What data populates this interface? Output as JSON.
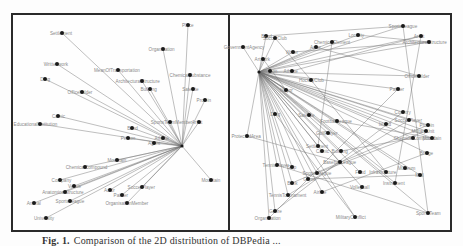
{
  "caption": {
    "label": "Fig. 1.",
    "text": "Comparison of the 2D distribution of DBPedia ..."
  },
  "panels": [
    {
      "id": "left",
      "hub": {
        "x": 182,
        "y": 146
      },
      "nodes": [
        {
          "label": "Place",
          "x": 188,
          "y": 25
        },
        {
          "label": "Settlement",
          "x": 62,
          "y": 33
        },
        {
          "label": "Organisation",
          "x": 163,
          "y": 49
        },
        {
          "label": "Writtenwork",
          "x": 57,
          "y": 64
        },
        {
          "label": "MeanOfTransportation",
          "x": 118,
          "y": 70
        },
        {
          "label": "ChemicalSubstance",
          "x": 190,
          "y": 75
        },
        {
          "label": "Drug",
          "x": 45,
          "y": 79
        },
        {
          "label": "ArchitecturalStructure",
          "x": 142,
          "y": 81
        },
        {
          "label": "Building",
          "x": 150,
          "y": 89
        },
        {
          "label": "Satellite",
          "x": 193,
          "y": 89
        },
        {
          "label": "Officeholder",
          "x": 82,
          "y": 92
        },
        {
          "label": "Protein",
          "x": 205,
          "y": 100
        },
        {
          "label": "Comic",
          "x": 58,
          "y": 116
        },
        {
          "label": "EducationalInstitution",
          "x": 40,
          "y": 124
        },
        {
          "label": "Band",
          "x": 132,
          "y": 128
        },
        {
          "label": "SportsTeamMember",
          "x": 170,
          "y": 122
        },
        {
          "label": "Artist",
          "x": 199,
          "y": 122
        },
        {
          "label": "Person",
          "x": 128,
          "y": 138
        },
        {
          "label": "Athlete",
          "x": 163,
          "y": 138
        },
        {
          "label": "Agent",
          "x": 154,
          "y": 143
        },
        {
          "label": "Mountain",
          "x": 117,
          "y": 160
        },
        {
          "label": "ChemicalCompound",
          "x": 85,
          "y": 167
        },
        {
          "label": "Company",
          "x": 60,
          "y": 180
        },
        {
          "label": "Venue",
          "x": 74,
          "y": 186
        },
        {
          "label": "AnatomicalStructure",
          "x": 65,
          "y": 192
        },
        {
          "label": "Animal",
          "x": 34,
          "y": 203
        },
        {
          "label": "SportsLeague",
          "x": 70,
          "y": 201
        },
        {
          "label": "Actor",
          "x": 110,
          "y": 190
        },
        {
          "label": "Painter",
          "x": 122,
          "y": 195
        },
        {
          "label": "SoccerPlayer",
          "x": 142,
          "y": 187
        },
        {
          "label": "OrganisationMember",
          "x": 127,
          "y": 203
        },
        {
          "label": "Mountain",
          "x": 211,
          "y": 180
        },
        {
          "label": "University",
          "x": 46,
          "y": 218
        }
      ]
    },
    {
      "id": "right",
      "hub": {
        "x": 259,
        "y": 72
      },
      "nodes": [
        {
          "label": "SportsLeague",
          "x": 403,
          "y": 26
        },
        {
          "label": "Band",
          "x": 266,
          "y": 36
        },
        {
          "label": "SoccerClub",
          "x": 275,
          "y": 38
        },
        {
          "label": "Locality",
          "x": 358,
          "y": 35
        },
        {
          "label": "Artist",
          "x": 421,
          "y": 36
        },
        {
          "label": "ChemicalElement",
          "x": 332,
          "y": 42
        },
        {
          "label": "ArchitecturalStructure",
          "x": 429,
          "y": 42
        },
        {
          "label": "GovernmentAgency",
          "x": 243,
          "y": 47
        },
        {
          "label": "Writer",
          "x": 293,
          "y": 52
        },
        {
          "label": "Actor",
          "x": 316,
          "y": 47
        },
        {
          "label": "Artwork",
          "x": 263,
          "y": 59
        },
        {
          "label": "Person",
          "x": 270,
          "y": 71
        },
        {
          "label": "Athlete",
          "x": 292,
          "y": 71
        },
        {
          "label": "HockeyClub",
          "x": 311,
          "y": 80
        },
        {
          "label": "Officeholder",
          "x": 419,
          "y": 76
        },
        {
          "label": "Painter",
          "x": 398,
          "y": 89
        },
        {
          "label": "Mayor",
          "x": 286,
          "y": 90
        },
        {
          "label": "Country",
          "x": 403,
          "y": 112
        },
        {
          "label": "Drug",
          "x": 275,
          "y": 114
        },
        {
          "label": "ProtectedArea",
          "x": 247,
          "y": 136
        },
        {
          "label": "Satellite",
          "x": 309,
          "y": 115
        },
        {
          "label": "FootballLeague",
          "x": 337,
          "y": 121
        },
        {
          "label": "Island",
          "x": 386,
          "y": 124
        },
        {
          "label": "SoccerPlayer",
          "x": 409,
          "y": 120
        },
        {
          "label": "Protein",
          "x": 428,
          "y": 125
        },
        {
          "label": "GolfPlayer",
          "x": 328,
          "y": 133
        },
        {
          "label": "MilitaryUnit",
          "x": 426,
          "y": 131
        },
        {
          "label": "ChemicalCompound",
          "x": 413,
          "y": 138
        },
        {
          "label": "Mountain",
          "x": 432,
          "y": 138
        },
        {
          "label": "Settlement",
          "x": 318,
          "y": 146
        },
        {
          "label": "Comic",
          "x": 322,
          "y": 151
        },
        {
          "label": "Building",
          "x": 341,
          "y": 151
        },
        {
          "label": "BaseballLeague",
          "x": 340,
          "y": 162
        },
        {
          "label": "Bridge",
          "x": 427,
          "y": 153
        },
        {
          "label": "TennisPlayer",
          "x": 277,
          "y": 165
        },
        {
          "label": "Ship",
          "x": 292,
          "y": 167
        },
        {
          "label": "SportsLeague",
          "x": 317,
          "y": 173
        },
        {
          "label": "Food",
          "x": 360,
          "y": 172
        },
        {
          "label": "Infrastructure",
          "x": 386,
          "y": 172
        },
        {
          "label": "Museum",
          "x": 405,
          "y": 168
        },
        {
          "label": "Mall",
          "x": 420,
          "y": 175
        },
        {
          "label": "Game",
          "x": 308,
          "y": 179
        },
        {
          "label": "Bank",
          "x": 292,
          "y": 183
        },
        {
          "label": "Instrument",
          "x": 395,
          "y": 183
        },
        {
          "label": "TennisTournament",
          "x": 288,
          "y": 195
        },
        {
          "label": "Volleyball",
          "x": 362,
          "y": 187
        },
        {
          "label": "Airline",
          "x": 322,
          "y": 192
        },
        {
          "label": "Genre",
          "x": 275,
          "y": 211
        },
        {
          "label": "Organisation",
          "x": 269,
          "y": 218
        },
        {
          "label": "MilitaryConflict",
          "x": 355,
          "y": 217
        },
        {
          "label": "SportsTeam",
          "x": 428,
          "y": 213
        }
      ],
      "extra_edges": [
        [
          [
            266,
            36
          ],
          [
            403,
            26
          ]
        ],
        [
          [
            292,
            71
          ],
          [
            421,
            36
          ]
        ],
        [
          [
            293,
            52
          ],
          [
            429,
            42
          ]
        ],
        [
          [
            316,
            47
          ],
          [
            419,
            76
          ]
        ],
        [
          [
            332,
            42
          ],
          [
            318,
            146
          ]
        ],
        [
          [
            358,
            35
          ],
          [
            429,
            42
          ]
        ],
        [
          [
            403,
            26
          ],
          [
            428,
            213
          ]
        ],
        [
          [
            421,
            36
          ],
          [
            395,
            183
          ]
        ],
        [
          [
            398,
            89
          ],
          [
            269,
            218
          ]
        ],
        [
          [
            403,
            112
          ],
          [
            275,
            211
          ]
        ],
        [
          [
            409,
            120
          ],
          [
            288,
            195
          ]
        ],
        [
          [
            428,
            125
          ],
          [
            292,
            183
          ]
        ],
        [
          [
            275,
            114
          ],
          [
            355,
            217
          ]
        ],
        [
          [
            247,
            136
          ],
          [
            340,
            162
          ]
        ],
        [
          [
            277,
            165
          ],
          [
            428,
            213
          ]
        ],
        [
          [
            311,
            80
          ],
          [
            386,
            172
          ]
        ],
        [
          [
            322,
            192
          ],
          [
            427,
            153
          ]
        ],
        [
          [
            337,
            121
          ],
          [
            432,
            138
          ]
        ],
        [
          [
            341,
            151
          ],
          [
            413,
            138
          ]
        ],
        [
          [
            317,
            173
          ],
          [
            426,
            131
          ]
        ],
        [
          [
            308,
            179
          ],
          [
            420,
            175
          ]
        ],
        [
          [
            275,
            38
          ],
          [
            311,
            80
          ]
        ],
        [
          [
            263,
            59
          ],
          [
            286,
            90
          ]
        ]
      ]
    }
  ],
  "colors": {
    "frame": "#2a2a2a",
    "edge": "#707070",
    "node": "#1a1a1a",
    "label": "#8a8a8a",
    "background": "#fefefe"
  }
}
